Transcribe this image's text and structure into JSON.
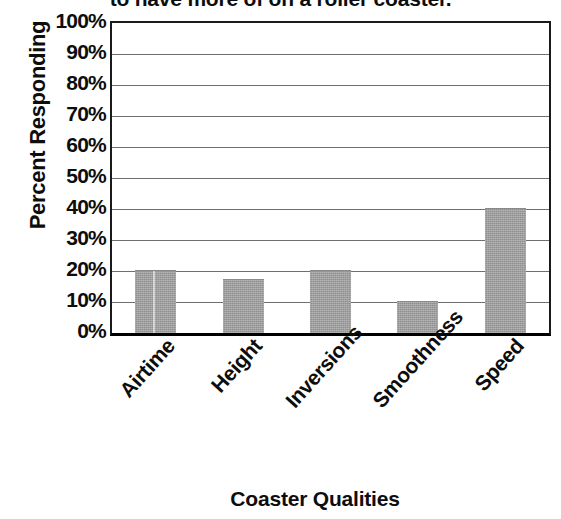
{
  "chart_data": {
    "type": "bar",
    "title": "to have more of on a roller coaster.",
    "subtitle": "",
    "xlabel": "Coaster Qualities",
    "ylabel": "Percent Responding",
    "categories": [
      "Airtime",
      "Height",
      "Inversions",
      "Smoothness",
      "Speed"
    ],
    "values": [
      20,
      17,
      20,
      10,
      40
    ],
    "series": [
      {
        "name": "Percent Responding",
        "values": [
          20,
          17,
          20,
          10,
          40
        ]
      }
    ],
    "ylim": [
      0,
      100
    ],
    "ytick_labels": [
      "100%",
      "90%",
      "80%",
      "70%",
      "60%",
      "50%",
      "40%",
      "30%",
      "20%",
      "10%",
      "0%"
    ],
    "ytick_values": [
      100,
      90,
      80,
      70,
      60,
      50,
      40,
      30,
      20,
      10,
      0
    ],
    "y_tick_step": 10,
    "value_suffix": "%",
    "grid": true,
    "grid_axis": "y",
    "legend": false,
    "legend_position": "none",
    "bar_color": "#9d9d9d",
    "bar_edge_color": "#8a8a8a",
    "gridline_color": "#6f6f6f",
    "axis_color": "#1a1a1a",
    "background_color": "#ffffff",
    "text_color": "#0d0d0d",
    "xtick_rotation": -48
  }
}
